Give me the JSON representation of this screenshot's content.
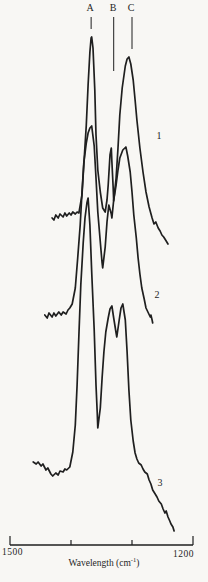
{
  "figure": {
    "background": "#f8f7f4",
    "ink": "#1f1f1f"
  },
  "chart_data": {
    "type": "line",
    "title": "",
    "xlabel": "Wavelength (cm-1)",
    "ylabel": "",
    "x_range": [
      1500,
      1200
    ],
    "grid": false,
    "legend": "curve numbers 1-3 printed beside right tail of each spectrum",
    "band_markers": [
      {
        "label": "A",
        "wavenumber_cm": 1367,
        "line_y1": 17,
        "line_y2": 29
      },
      {
        "label": "B",
        "wavenumber_cm": 1330,
        "line_y1": 17,
        "line_y2": 71
      },
      {
        "label": "C",
        "wavenumber_cm": 1300,
        "line_y1": 17,
        "line_y2": 49
      }
    ],
    "curve_labels": [
      {
        "text": "1"
      },
      {
        "text": "2"
      },
      {
        "text": "3"
      }
    ],
    "x_axis": {
      "y": 545,
      "x1": 10,
      "x2": 193,
      "label_left": "1500",
      "label_right": "1200",
      "ticks_wn": [
        1500,
        1400,
        1300,
        1200
      ],
      "title_prefix": "Wavelength (cm",
      "title_sup": "-1",
      "title_suffix": ")"
    },
    "series": [
      {
        "name": "1",
        "points": [
          [
            1431,
            327
          ],
          [
            1428,
            325
          ],
          [
            1425,
            330
          ],
          [
            1421,
            327
          ],
          [
            1418,
            331
          ],
          [
            1413,
            328
          ],
          [
            1410,
            332
          ],
          [
            1407,
            329
          ],
          [
            1403,
            332
          ],
          [
            1400,
            330
          ],
          [
            1397,
            333
          ],
          [
            1393,
            331
          ],
          [
            1390,
            333
          ],
          [
            1387,
            332
          ],
          [
            1382,
            350
          ],
          [
            1379,
            380
          ],
          [
            1375,
            420
          ],
          [
            1372,
            460
          ],
          [
            1369,
            493
          ],
          [
            1367,
            507
          ],
          [
            1366,
            508
          ],
          [
            1364,
            497
          ],
          [
            1361,
            455
          ],
          [
            1359,
            410
          ],
          [
            1356,
            375
          ],
          [
            1352,
            353
          ],
          [
            1348,
            337
          ],
          [
            1344,
            333
          ],
          [
            1341,
            345
          ],
          [
            1339,
            360
          ],
          [
            1336,
            390
          ],
          [
            1334,
            397
          ],
          [
            1333,
            383
          ],
          [
            1331,
            359
          ],
          [
            1330,
            344
          ],
          [
            1326,
            367
          ],
          [
            1323,
            397
          ],
          [
            1320,
            430
          ],
          [
            1316,
            457
          ],
          [
            1311,
            479
          ],
          [
            1308,
            486
          ],
          [
            1305,
            488
          ],
          [
            1302,
            481
          ],
          [
            1298,
            465
          ],
          [
            1295,
            445
          ],
          [
            1292,
            425
          ],
          [
            1287,
            397
          ],
          [
            1282,
            373
          ],
          [
            1277,
            353
          ],
          [
            1272,
            338
          ],
          [
            1267,
            327
          ],
          [
            1264,
            321
          ],
          [
            1261,
            323
          ],
          [
            1257,
            317
          ],
          [
            1254,
            314
          ],
          [
            1251,
            310
          ],
          [
            1248,
            308
          ],
          [
            1244,
            304
          ],
          [
            1241,
            301
          ]
        ]
      },
      {
        "name": "2",
        "points": [
          [
            1443,
            230
          ],
          [
            1439,
            227
          ],
          [
            1436,
            232
          ],
          [
            1431,
            228
          ],
          [
            1428,
            232
          ],
          [
            1425,
            229
          ],
          [
            1420,
            233
          ],
          [
            1416,
            230
          ],
          [
            1413,
            233
          ],
          [
            1408,
            231
          ],
          [
            1405,
            235
          ],
          [
            1402,
            237
          ],
          [
            1398,
            241
          ],
          [
            1393,
            257
          ],
          [
            1389,
            287
          ],
          [
            1385,
            320
          ],
          [
            1382,
            353
          ],
          [
            1379,
            382
          ],
          [
            1375,
            402
          ],
          [
            1372,
            412
          ],
          [
            1369,
            417
          ],
          [
            1366,
            419
          ],
          [
            1362,
            399
          ],
          [
            1359,
            367
          ],
          [
            1356,
            333
          ],
          [
            1352,
            303
          ],
          [
            1349,
            282
          ],
          [
            1348,
            277
          ],
          [
            1344,
            298
          ],
          [
            1341,
            323
          ],
          [
            1338,
            340
          ],
          [
            1334,
            331
          ],
          [
            1333,
            327
          ],
          [
            1330,
            345
          ],
          [
            1326,
            360
          ],
          [
            1323,
            375
          ],
          [
            1320,
            387
          ],
          [
            1315,
            395
          ],
          [
            1310,
            398
          ],
          [
            1307,
            389
          ],
          [
            1303,
            373
          ],
          [
            1300,
            353
          ],
          [
            1297,
            330
          ],
          [
            1293,
            307
          ],
          [
            1290,
            287
          ],
          [
            1287,
            271
          ],
          [
            1284,
            257
          ],
          [
            1280,
            246
          ],
          [
            1277,
            237
          ],
          [
            1274,
            233
          ],
          [
            1270,
            228
          ],
          [
            1269,
            230
          ],
          [
            1267,
            225
          ],
          [
            1266,
            222
          ]
        ]
      },
      {
        "name": "3",
        "points": [
          [
            1462,
            83
          ],
          [
            1457,
            81
          ],
          [
            1454,
            83
          ],
          [
            1449,
            79
          ],
          [
            1446,
            81
          ],
          [
            1441,
            75
          ],
          [
            1438,
            77
          ],
          [
            1433,
            71
          ],
          [
            1430,
            69
          ],
          [
            1425,
            72
          ],
          [
            1421,
            70
          ],
          [
            1418,
            74
          ],
          [
            1413,
            73
          ],
          [
            1410,
            76
          ],
          [
            1407,
            75
          ],
          [
            1402,
            78
          ],
          [
            1397,
            93
          ],
          [
            1393,
            120
          ],
          [
            1390,
            160
          ],
          [
            1387,
            210
          ],
          [
            1384,
            260
          ],
          [
            1380,
            302
          ],
          [
            1377,
            327
          ],
          [
            1374,
            342
          ],
          [
            1372,
            347
          ],
          [
            1369,
            320
          ],
          [
            1366,
            273
          ],
          [
            1362,
            215
          ],
          [
            1359,
            160
          ],
          [
            1357,
            133
          ],
          [
            1356,
            117
          ],
          [
            1352,
            137
          ],
          [
            1349,
            167
          ],
          [
            1346,
            193
          ],
          [
            1343,
            213
          ],
          [
            1339,
            227
          ],
          [
            1336,
            236
          ],
          [
            1333,
            239
          ],
          [
            1330,
            227
          ],
          [
            1326,
            212
          ],
          [
            1325,
            208
          ],
          [
            1321,
            225
          ],
          [
            1318,
            237
          ],
          [
            1315,
            241
          ],
          [
            1311,
            225
          ],
          [
            1308,
            193
          ],
          [
            1305,
            155
          ],
          [
            1302,
            125
          ],
          [
            1298,
            104
          ],
          [
            1295,
            92
          ],
          [
            1292,
            86
          ],
          [
            1289,
            82
          ],
          [
            1285,
            80
          ],
          [
            1282,
            76
          ],
          [
            1279,
            73
          ],
          [
            1275,
            71
          ],
          [
            1272,
            65
          ],
          [
            1269,
            61
          ],
          [
            1266,
            55
          ],
          [
            1262,
            51
          ],
          [
            1259,
            48
          ],
          [
            1256,
            44
          ],
          [
            1252,
            41
          ],
          [
            1249,
            36
          ],
          [
            1246,
            32
          ],
          [
            1244,
            34
          ],
          [
            1241,
            28
          ],
          [
            1238,
            24
          ],
          [
            1236,
            21
          ],
          [
            1233,
            18
          ],
          [
            1231,
            14
          ]
        ]
      }
    ]
  }
}
